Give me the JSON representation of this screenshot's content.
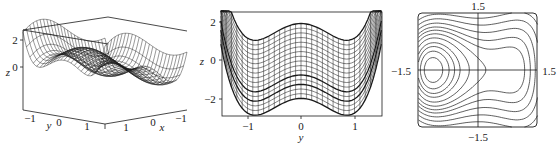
{
  "chart_data": [
    {
      "type": "surface3d",
      "title": "",
      "description": "Wireframe 3D surface of z over (x, y) in [-1.5,1.5]^2 showing a saddle/double-well shaped landscape",
      "xlabel": "x",
      "ylabel": "y",
      "zlabel": "z",
      "x_ticks": [
        "1",
        "0",
        "−1"
      ],
      "y_ticks": [
        "−1",
        "0",
        "1"
      ],
      "z_ticks": [
        "2",
        "0"
      ],
      "zlim": [
        -3,
        2.5
      ],
      "grid": "wireframe mesh"
    },
    {
      "type": "line",
      "title": "",
      "description": "Side projection of the wireframe surface onto the y-z plane: family of curves z(y) for fixed x; double-well profile with minima near y=±1 and local max at y=0",
      "xlabel": "y",
      "ylabel": "z",
      "x_ticks": [
        "−1",
        "0",
        "1"
      ],
      "y_ticks": [
        "2",
        "0",
        "−2"
      ],
      "xlim": [
        -1.5,
        1.5
      ],
      "ylim": [
        -3,
        2.5
      ],
      "series": [
        {
          "name": "upper envelope",
          "x": [
            -1.5,
            -1,
            0,
            1,
            1.5
          ],
          "values": [
            2.5,
            1.0,
            1.9,
            1.0,
            2.5
          ]
        },
        {
          "name": "lower envelope",
          "x": [
            -1.5,
            -1,
            0,
            1,
            1.5
          ],
          "values": [
            -0.5,
            -3.0,
            -2.0,
            -3.0,
            -0.5
          ]
        },
        {
          "name": "highlighted curve 1",
          "x": [
            -1.5,
            -1,
            0,
            1,
            1.5
          ],
          "values": [
            0.3,
            -2.0,
            -1.1,
            -2.0,
            0.3
          ]
        },
        {
          "name": "highlighted curve 2",
          "x": [
            -1.5,
            -1,
            0,
            1,
            1.5
          ],
          "values": [
            -0.3,
            -2.5,
            -1.6,
            -2.5,
            -0.3
          ]
        }
      ],
      "grid": false
    },
    {
      "type": "contour",
      "title": "",
      "description": "Contour (level-set) plot in the plane with axes through origin; separatrix X-crossings at left (top/bottom corners) and right (middle) with closed orbits around centers",
      "axis_labels": {
        "top": "1.5",
        "bottom": "−1.5",
        "left": "−1.5",
        "right": "1.5"
      },
      "xlim": [
        -1.5,
        1.5
      ],
      "ylim": [
        -1.5,
        1.5
      ],
      "grid": false
    }
  ],
  "panel1": {
    "z_label": "z",
    "z_tick_2": "2",
    "z_tick_0": "0",
    "y_label": "y",
    "y_tick_m1": "−1",
    "y_tick_0": "0",
    "y_tick_1": "1",
    "x_label": "x",
    "x_tick_1": "1",
    "x_tick_0": "0",
    "x_tick_m1": "−1"
  },
  "panel2": {
    "z_label": "z",
    "tick_2": "2",
    "tick_0": "0",
    "tick_m2": "−2",
    "y_label": "y",
    "ytick_m1": "−1",
    "ytick_0": "0",
    "ytick_1": "1"
  },
  "panel3": {
    "top": "1.5",
    "bottom": "−1.5",
    "left": "−1.5",
    "right": "1.5"
  },
  "colors": {
    "ink": "#1a1a1a",
    "background": "#ffffff"
  }
}
